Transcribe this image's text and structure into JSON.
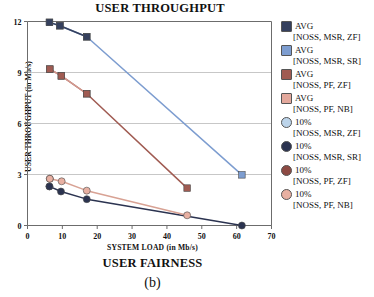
{
  "chart_data": {
    "type": "line",
    "title": "USER THROUGHPUT",
    "xlabel": "SYSTEM LOAD (in Mb/s)",
    "ylabel": "USER THROUGHPUT (in Mb/s)",
    "subcaption": "USER FAIRNESS",
    "figure_label": "(b)",
    "xlim": [
      0,
      70
    ],
    "ylim": [
      0,
      12
    ],
    "xticks": [
      0,
      10,
      20,
      30,
      40,
      50,
      60,
      70
    ],
    "yticks": [
      0,
      3,
      6,
      9,
      12
    ],
    "xtick_labels": [
      "0",
      "10",
      "20",
      "30",
      "40",
      "50",
      "60",
      "70"
    ],
    "ytick_labels": [
      "0",
      "3",
      "6",
      "9",
      "12"
    ],
    "grid": "horizontal",
    "legend_position": "right",
    "series": [
      {
        "name": "AVG",
        "sub": "[NOSS, MSR, ZF]",
        "marker": "square",
        "color": "#35405e",
        "line_color": "#35405e",
        "points": [
          [
            6.3,
            11.95
          ],
          [
            9.3,
            11.75
          ],
          [
            17.0,
            11.1
          ]
        ]
      },
      {
        "name": "AVG",
        "sub": "[NOSS, MSR, SR]",
        "marker": "square",
        "color": "#7d9dd0",
        "line_color": "#7d9dd0",
        "points": [
          [
            6.3,
            11.95
          ],
          [
            9.3,
            11.75
          ],
          [
            17.0,
            11.1
          ],
          [
            61.5,
            2.98
          ]
        ]
      },
      {
        "name": "AVG",
        "sub": "[NOSS, PF, ZF]",
        "marker": "square",
        "color": "#a05b52",
        "line_color": "#a05b52",
        "points": [
          [
            6.4,
            9.2
          ],
          [
            9.7,
            8.8
          ],
          [
            17.0,
            7.75
          ],
          [
            45.8,
            2.2
          ]
        ]
      },
      {
        "name": "AVG",
        "sub": "[NOSS, PF, NB]",
        "marker": "square",
        "color": "#e3a89c",
        "line_color": "#d49a90",
        "points": [
          [
            6.4,
            9.2
          ],
          [
            9.7,
            8.8
          ],
          [
            17.0,
            7.75
          ]
        ]
      },
      {
        "name": "10%",
        "sub": "[NOSS, MSR, ZF]",
        "marker": "circle",
        "color": "#bcd4ea",
        "line_color": "#bcd4ea",
        "points": [
          [
            6.3,
            2.3
          ]
        ]
      },
      {
        "name": "10%",
        "sub": "[NOSS, MSR, SR]",
        "marker": "circle",
        "color": "#2b3350",
        "line_color": "#2b3350",
        "points": [
          [
            6.3,
            2.3
          ],
          [
            9.6,
            2.0
          ],
          [
            17.0,
            1.55
          ],
          [
            61.5,
            0.0
          ]
        ]
      },
      {
        "name": "10%",
        "sub": "[NOSS, PF, ZF]",
        "marker": "circle",
        "color": "#8d4a43",
        "line_color": "#8d4a43",
        "points": [
          [
            6.4,
            2.75
          ]
        ]
      },
      {
        "name": "10%",
        "sub": "[NOSS, PF, NB]",
        "marker": "circle",
        "color": "#e8b0a2",
        "line_color": "#d8a294",
        "points": [
          [
            6.4,
            2.75
          ],
          [
            9.8,
            2.6
          ],
          [
            17.0,
            2.05
          ],
          [
            45.8,
            0.6
          ]
        ]
      }
    ]
  }
}
